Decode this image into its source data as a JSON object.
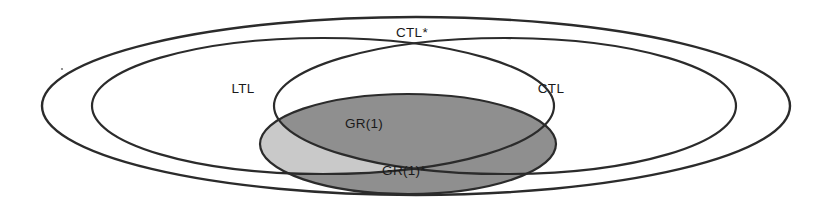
{
  "diagram": {
    "type": "venn-euler-diagram",
    "title_visible": false,
    "background_color": "#ffffff",
    "stroke_color": "#2b2b2b",
    "regions": [
      {
        "id": "ctl-star",
        "label": "CTL*",
        "fill": "none",
        "role": "outermost-set",
        "label_position": {
          "x": 412,
          "y": 33
        },
        "geometry": {
          "cx": 416,
          "cy": 106,
          "rx": 374,
          "ry": 89
        }
      },
      {
        "id": "ltl",
        "label": "LTL",
        "fill": "none",
        "role": "left-inner-set",
        "label_position": {
          "x": 243,
          "y": 89
        },
        "geometry": {
          "cx": 323,
          "cy": 106,
          "rx": 231,
          "ry": 68
        }
      },
      {
        "id": "ctl",
        "label": "CTL",
        "fill": "none",
        "role": "right-inner-set",
        "label_position": {
          "x": 551,
          "y": 89
        },
        "geometry": {
          "cx": 505,
          "cy": 106,
          "rx": 231,
          "ry": 68
        }
      },
      {
        "id": "gr1",
        "label": "GR(1)",
        "fill": "#c9c9c9",
        "role": "light-shaded-region",
        "label_position": {
          "x": 364,
          "y": 124
        },
        "geometry": {
          "cx": 408,
          "cy": 144,
          "rx": 148,
          "ry": 50
        }
      },
      {
        "id": "gr1-star",
        "label": "GR(1)*",
        "fill": "#8f8f8f",
        "role": "dark-shaded-region",
        "label_position": {
          "x": 404,
          "y": 171
        }
      }
    ],
    "colors": {
      "light_shade": "#c9c9c9",
      "dark_shade": "#8f8f8f",
      "outline": "#2b2b2b",
      "text": "#1a1a1a",
      "background": "#ffffff"
    },
    "labels": {
      "ctl_star": "CTL*",
      "ltl": "LTL",
      "ctl": "CTL",
      "gr1": "GR(1)",
      "gr1_star": "GR(1)*"
    }
  }
}
